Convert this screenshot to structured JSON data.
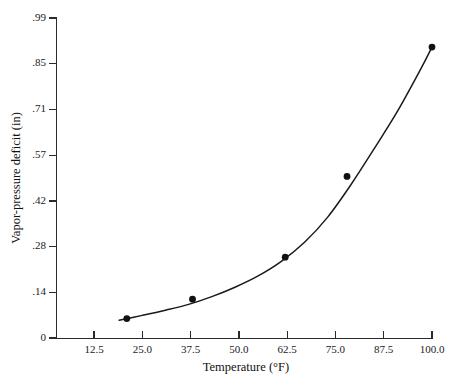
{
  "chart_data": {
    "type": "scatter",
    "title": "",
    "subtitle": "",
    "xlabel": "Temperature (°F)",
    "ylabel": "Vapor-pressure deficit (in)",
    "xlim": [
      6.25,
      100.0
    ],
    "ylim": [
      0,
      0.99
    ],
    "x_ticks": [
      12.5,
      25.0,
      37.5,
      50.0,
      62.5,
      75.0,
      87.5,
      100.0
    ],
    "x_tick_labels": [
      "12.5",
      "25.0",
      "37.5",
      "50.0",
      "62.5",
      "75.0",
      "87.5",
      "100.0"
    ],
    "y_ticks": [
      0,
      0.14,
      0.28,
      0.42,
      0.57,
      0.71,
      0.85,
      0.99
    ],
    "y_tick_labels": [
      "0",
      ".14",
      ".28",
      ".42",
      ".57",
      ".71",
      ".85",
      ".99"
    ],
    "grid": false,
    "legend": false,
    "legend_position": "none",
    "series": [
      {
        "name": "Vapor-pressure deficit",
        "marker": "filled-circle",
        "marker_color": "#111111",
        "line_color": "#1a1a1a",
        "fit": "smooth-exponential-curve",
        "x": [
          21.0,
          38.0,
          62.0,
          78.0,
          100.0
        ],
        "y": [
          0.06,
          0.12,
          0.25,
          0.5,
          0.9
        ],
        "points": [
          {
            "x": 21.0,
            "y": 0.06
          },
          {
            "x": 38.0,
            "y": 0.12
          },
          {
            "x": 62.0,
            "y": 0.25
          },
          {
            "x": 78.0,
            "y": 0.5
          },
          {
            "x": 100.0,
            "y": 0.9
          }
        ]
      }
    ],
    "curve": {
      "x": [
        19.0,
        25.0,
        31.0,
        37.0,
        43.0,
        49.0,
        55.0,
        61.0,
        67.0,
        73.0,
        79.0,
        85.0,
        91.0,
        97.0,
        100.0
      ],
      "y": [
        0.055,
        0.07,
        0.086,
        0.104,
        0.128,
        0.157,
        0.192,
        0.237,
        0.296,
        0.374,
        0.474,
        0.585,
        0.7,
        0.83,
        0.9
      ]
    }
  },
  "colors": {
    "background": "#ffffff",
    "axis": "#2b2b2b",
    "text": "#1a1a1a",
    "marker": "#111111",
    "curve": "#1a1a1a"
  },
  "axes": {
    "x_axis_name": "temperature-axis",
    "y_axis_name": "vapor-pressure-deficit-axis"
  }
}
